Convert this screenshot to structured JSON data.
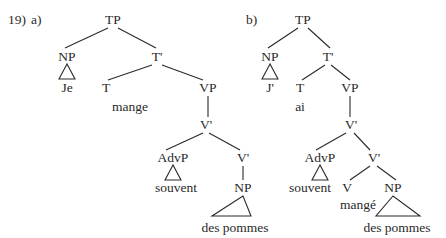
{
  "example_number": "19)",
  "trees": [
    {
      "label": "a)",
      "nodes": {
        "TP": "TP",
        "NP": "NP",
        "NP_word": "Je",
        "Tbar": "T'",
        "T": "T",
        "T_word": "mange",
        "VP": "VP",
        "Vbar1": "V'",
        "AdvP": "AdvP",
        "AdvP_word": "souvent",
        "Vbar2": "V'",
        "NP2": "NP",
        "NP2_word": "des pommes"
      }
    },
    {
      "label": "b)",
      "nodes": {
        "TP": "TP",
        "NP": "NP",
        "NP_word": "J'",
        "Tbar": "T'",
        "T": "T",
        "T_word": "ai",
        "VP": "VP",
        "Vbar1": "V'",
        "AdvP": "AdvP",
        "AdvP_word": "souvent",
        "Vbar2": "V'",
        "V": "V",
        "V_word": "mangé",
        "NP2": "NP",
        "NP2_word": "des pommes"
      }
    }
  ]
}
